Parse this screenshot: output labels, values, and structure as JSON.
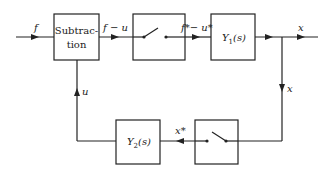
{
  "diagram": {
    "type": "block-diagram",
    "blocks": [
      {
        "id": "subtraction",
        "label_line1": "Subtrac-",
        "label_line2": "tion"
      },
      {
        "id": "sampler1",
        "label": ""
      },
      {
        "id": "y1",
        "label": "Y",
        "sub": "1",
        "arg": "(s)"
      },
      {
        "id": "sampler2",
        "label": ""
      },
      {
        "id": "y2",
        "label": "Y",
        "sub": "2",
        "arg": "(s)"
      }
    ],
    "signals": {
      "input": "f",
      "error": "f − u",
      "sampled_error": "f*− u*",
      "output": "x",
      "feedback_tap": "x",
      "sampled_output": "x*",
      "feedback": "u"
    },
    "colors": {
      "line": "#222222",
      "background": "#ffffff"
    }
  }
}
